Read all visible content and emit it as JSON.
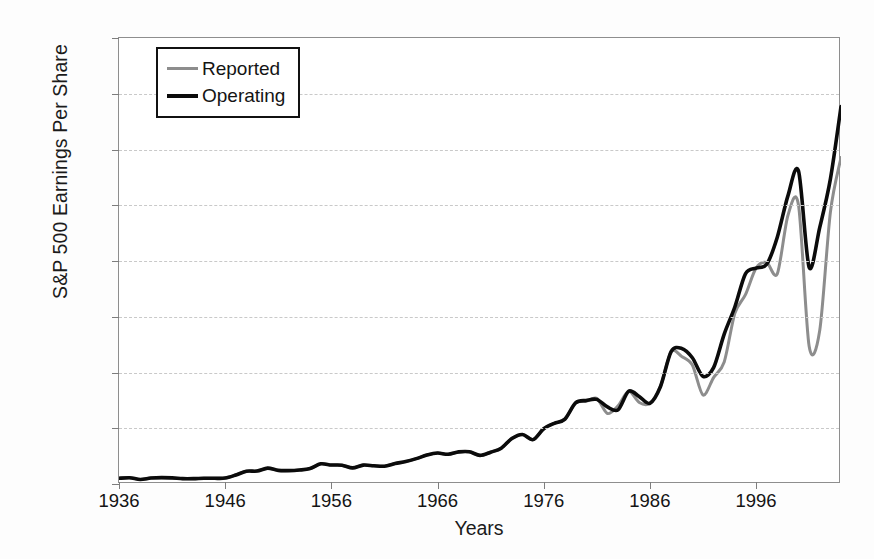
{
  "chart_data": {
    "type": "line",
    "title": "",
    "xlabel": "Years",
    "ylabel": "S&P 500 Earnings Per Share",
    "xlim": [
      1936,
      2004
    ],
    "ylim": [
      0,
      80
    ],
    "grid": true,
    "legend_position": "top-left",
    "y_tick_labels": [
      "$0.00",
      "$10.00",
      "$20.00",
      "$30.00",
      "$40.00",
      "$50.00",
      "$60.00",
      "$70.00",
      "$80.00"
    ],
    "y_tick_values": [
      0,
      10,
      20,
      30,
      40,
      50,
      60,
      70,
      80
    ],
    "x_tick_labels": [
      "1936",
      "1946",
      "1956",
      "1966",
      "1976",
      "1986",
      "1996"
    ],
    "x_tick_values": [
      1936,
      1946,
      1956,
      1966,
      1976,
      1986,
      1996
    ],
    "x": [
      1936,
      1937,
      1938,
      1939,
      1940,
      1941,
      1942,
      1943,
      1944,
      1945,
      1946,
      1947,
      1948,
      1949,
      1950,
      1951,
      1952,
      1953,
      1954,
      1955,
      1956,
      1957,
      1958,
      1959,
      1960,
      1961,
      1962,
      1963,
      1964,
      1965,
      1966,
      1967,
      1968,
      1969,
      1970,
      1971,
      1972,
      1973,
      1974,
      1975,
      1976,
      1977,
      1978,
      1979,
      1980,
      1981,
      1982,
      1983,
      1984,
      1985,
      1986,
      1987,
      1988,
      1989,
      1990,
      1991,
      1992,
      1993,
      1994,
      1995,
      1996,
      1997,
      1998,
      1999,
      2000,
      2001,
      2002,
      2003,
      2004
    ],
    "series": [
      {
        "name": "Operating",
        "color": "#0b0b0b",
        "values": [
          1.02,
          1.13,
          0.81,
          1.07,
          1.14,
          1.09,
          0.96,
          0.96,
          1.03,
          1.02,
          1.06,
          1.61,
          2.29,
          2.32,
          2.84,
          2.44,
          2.4,
          2.51,
          2.77,
          3.62,
          3.41,
          3.37,
          2.89,
          3.39,
          3.27,
          3.19,
          3.67,
          4.02,
          4.55,
          5.19,
          5.55,
          5.33,
          5.76,
          5.78,
          5.13,
          5.7,
          6.42,
          8.16,
          8.89,
          7.96,
          9.91,
          10.89,
          11.64,
          14.55,
          14.99,
          15.18,
          13.82,
          13.29,
          16.64,
          15.68,
          14.48,
          17.5,
          23.75,
          24.32,
          22.65,
          19.3,
          20.87,
          26.9,
          31.75,
          37.7,
          38.73,
          39.4,
          44.27,
          51.68,
          56.13,
          38.85,
          46.04,
          54.69,
          67.68
        ]
      },
      {
        "name": "Reported",
        "color": "#8d8d8d",
        "values": [
          1.02,
          1.13,
          0.81,
          1.07,
          1.14,
          1.09,
          0.96,
          0.96,
          1.03,
          1.02,
          1.06,
          1.61,
          2.29,
          2.32,
          2.84,
          2.44,
          2.4,
          2.51,
          2.77,
          3.62,
          3.41,
          3.37,
          2.89,
          3.39,
          3.27,
          3.19,
          3.67,
          4.02,
          4.55,
          5.19,
          5.55,
          5.33,
          5.76,
          5.78,
          5.13,
          5.7,
          6.42,
          8.16,
          8.89,
          7.96,
          9.91,
          10.89,
          11.64,
          14.55,
          14.82,
          15.36,
          12.64,
          14.03,
          16.64,
          14.61,
          14.48,
          17.5,
          23.75,
          22.87,
          21.34,
          15.97,
          19.09,
          21.89,
          30.6,
          33.96,
          38.73,
          39.72,
          37.71,
          48.17,
          50.0,
          24.69,
          27.59,
          48.73,
          58.55
        ]
      }
    ],
    "legend": [
      {
        "label": "Reported",
        "color": "#8d8d8d",
        "weight": "thin"
      },
      {
        "label": "Operating",
        "color": "#0b0b0b",
        "weight": "thick"
      }
    ]
  }
}
